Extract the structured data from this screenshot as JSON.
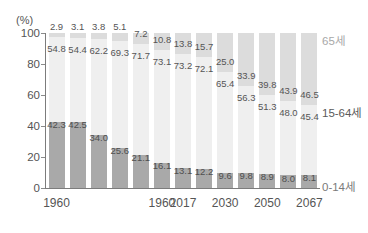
{
  "chart_data": {
    "type": "bar",
    "stacked": true,
    "title": "",
    "subtitle": "",
    "xlabel": "",
    "ylabel": "(%)",
    "ylim": [
      0,
      100
    ],
    "yticks": [
      "0",
      "20",
      "40",
      "60",
      "80",
      "100"
    ],
    "grid": false,
    "legend_position": "right",
    "categories": [
      "1960",
      "",
      "",
      "",
      "",
      "1960",
      "2017",
      "",
      "2030",
      "",
      "2050",
      "",
      "2067"
    ],
    "visible_xticks": [
      {
        "index": 0,
        "label": "1960"
      },
      {
        "index": 5,
        "label": "1960"
      },
      {
        "index": 6,
        "label": "2017"
      },
      {
        "index": 8,
        "label": "2030"
      },
      {
        "index": 10,
        "label": "2050"
      },
      {
        "index": 12,
        "label": "2067"
      }
    ],
    "series": [
      {
        "name": "0-14세",
        "key": "young",
        "color": "#a9a9a9",
        "values": [
          42.3,
          42.5,
          34.0,
          25.6,
          21.1,
          16.1,
          13.1,
          12.2,
          9.6,
          9.8,
          8.9,
          8.0,
          8.1
        ]
      },
      {
        "name": "15-64세",
        "key": "mid",
        "color": "#efefef",
        "values": [
          54.8,
          54.4,
          62.2,
          69.3,
          71.7,
          73.1,
          73.2,
          72.1,
          65.4,
          56.3,
          51.3,
          48.0,
          45.4
        ]
      },
      {
        "name": "65세",
        "key": "old",
        "color": "#dcdcdc",
        "values": [
          2.9,
          3.1,
          3.8,
          5.1,
          7.2,
          10.8,
          13.8,
          15.7,
          25.0,
          33.9,
          39.8,
          43.9,
          46.5
        ]
      }
    ]
  },
  "legend": {
    "old": "65세",
    "mid": "15-64세",
    "young": "0-14세"
  },
  "axis": {
    "unit": "(%)"
  },
  "colors": {
    "young": "#a9a9a9",
    "mid": "#efefef",
    "old": "#dcdcdc",
    "axis": "#7c7c7c",
    "text": "#555555"
  }
}
